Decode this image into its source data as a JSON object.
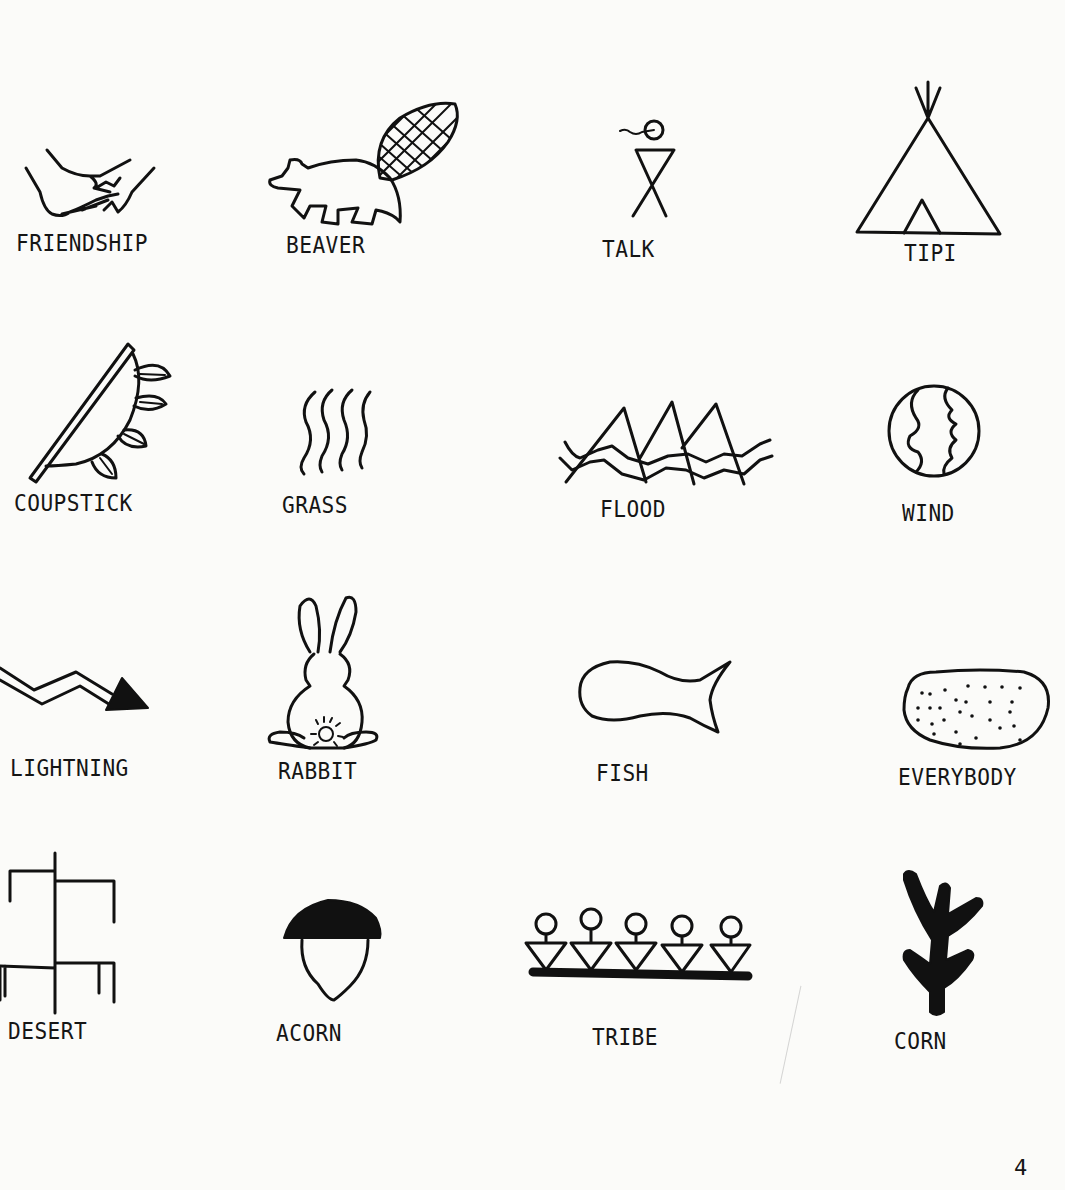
{
  "document": {
    "type": "pictograph reference sheet",
    "page_number": "4",
    "symbols": [
      {
        "label": "FRIENDSHIP",
        "icon": "friendship-hands-icon"
      },
      {
        "label": "BEAVER",
        "icon": "beaver-icon"
      },
      {
        "label": "TALK",
        "icon": "talk-figure-icon"
      },
      {
        "label": "TIPI",
        "icon": "tipi-icon"
      },
      {
        "label": "COUPSTICK",
        "icon": "coupstick-icon"
      },
      {
        "label": "GRASS",
        "icon": "grass-icon"
      },
      {
        "label": "FLOOD",
        "icon": "flood-icon"
      },
      {
        "label": "WIND",
        "icon": "wind-icon"
      },
      {
        "label": "LIGHTNING",
        "icon": "lightning-icon"
      },
      {
        "label": "RABBIT",
        "icon": "rabbit-icon"
      },
      {
        "label": "FISH",
        "icon": "fish-icon"
      },
      {
        "label": "EVERYBODY",
        "icon": "everybody-icon"
      },
      {
        "label": "DESERT",
        "icon": "desert-icon"
      },
      {
        "label": "ACORN",
        "icon": "acorn-icon"
      },
      {
        "label": "TRIBE",
        "icon": "tribe-icon"
      },
      {
        "label": "CORN",
        "icon": "corn-icon"
      }
    ]
  }
}
